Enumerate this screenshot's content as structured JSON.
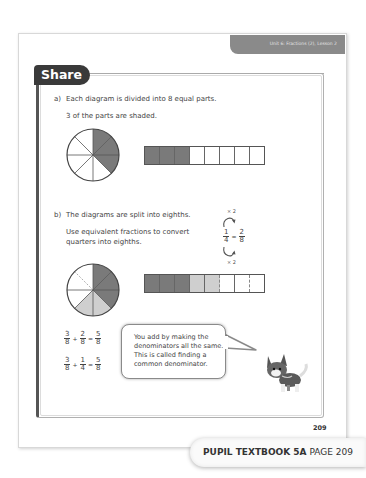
{
  "header": {
    "unit_label": "Unit 6: Fractions (2), Lesson 2"
  },
  "section_title": "Share",
  "part_a": {
    "label": "a)",
    "line1": "Each diagram is divided into 8 equal parts.",
    "line2": "3 of the parts are shaded.",
    "circle": {
      "parts": 8,
      "shaded_dark": 3
    },
    "bar": [
      "dark",
      "dark",
      "dark",
      "white",
      "white",
      "white",
      "white",
      "white"
    ]
  },
  "part_b": {
    "label": "b)",
    "line1": "The diagrams are split into eighths.",
    "line2": "Use equivalent fractions to convert",
    "line3": "quarters into eighths.",
    "equivalence": {
      "top_op": "× 2",
      "bottom_op": "× 2",
      "left_num": "1",
      "left_den": "4",
      "eq": "=",
      "right_num": "2",
      "right_den": "8"
    },
    "circle": {
      "parts": 8,
      "shaded_dark": 3,
      "shaded_light": 2
    },
    "bar": [
      "dark",
      "dark",
      "dark",
      "light",
      "light",
      "white",
      "white",
      "white"
    ]
  },
  "equations": [
    {
      "a_num": "3",
      "a_den": "8",
      "op": "+",
      "b_num": "2",
      "b_den": "8",
      "eq": "=",
      "r_num": "5",
      "r_den": "8"
    },
    {
      "a_num": "3",
      "a_den": "8",
      "op": "+",
      "b_num": "1",
      "b_den": "4",
      "eq": "=",
      "r_num": "5",
      "r_den": "8"
    }
  ],
  "speech_bubble": {
    "lines": [
      "You add by making the",
      "denominators all the same.",
      "This is called finding a",
      "common denominator."
    ]
  },
  "page_number": "209",
  "footer": {
    "book": "PUPIL TEXTBOOK 5A",
    "page": "PAGE 209"
  },
  "colors": {
    "dark_shade": "#7a7a7a",
    "light_shade": "#cfcfcf",
    "tab_bg": "#3a3a3a",
    "unit_band": "#8a8a8a"
  }
}
